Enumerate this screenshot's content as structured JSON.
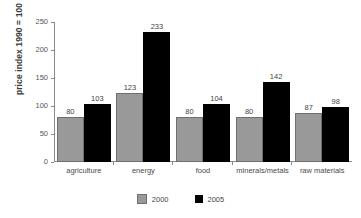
{
  "chart_data": {
    "type": "bar",
    "title": "",
    "xlabel": "",
    "ylabel": "price index 1990 = 100",
    "ylim": [
      0,
      250
    ],
    "yticks": [
      0,
      50,
      100,
      150,
      200,
      250
    ],
    "grid": false,
    "legend_position": "bottom-center",
    "categories": [
      "agriculture",
      "energy",
      "food",
      "minerals/metals",
      "raw materials"
    ],
    "series": [
      {
        "name": "2000",
        "color": "#999999",
        "values": [
          80,
          123,
          80,
          80,
          87
        ]
      },
      {
        "name": "2005",
        "color": "#000000",
        "values": [
          103,
          233,
          104,
          142,
          98
        ]
      }
    ]
  },
  "legend": {
    "items": [
      {
        "label": "2000",
        "swatch": "gray-square-swatch"
      },
      {
        "label": "2005",
        "swatch": "black-square-swatch"
      }
    ]
  }
}
